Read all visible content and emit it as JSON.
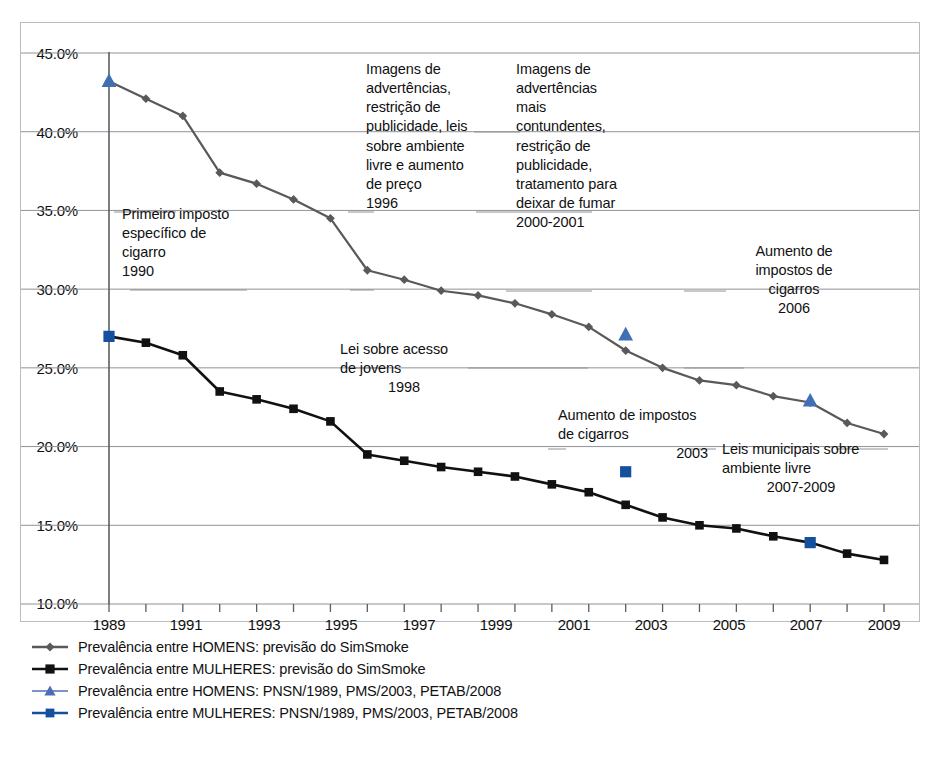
{
  "chart_data": {
    "type": "line",
    "title": "",
    "xlabel": "",
    "ylabel": "",
    "xlim": [
      1989,
      2010
    ],
    "ylim": [
      10.0,
      45.0
    ],
    "grid": true,
    "legend_position": "bottom-left",
    "ytick_labels": [
      "45.0%",
      "40.0%",
      "35.0%",
      "30.0%",
      "25.0%",
      "20.0%",
      "15.0%",
      "10.0%"
    ],
    "ytick_values": [
      45.0,
      40.0,
      35.0,
      30.0,
      25.0,
      20.0,
      15.0,
      10.0
    ],
    "xtick_labels": [
      "1989",
      "1991",
      "1993",
      "1995",
      "1997",
      "1999",
      "2001",
      "2003",
      "2005",
      "2007",
      "2009"
    ],
    "xtick_values": [
      1989,
      1991,
      1993,
      1995,
      1997,
      1999,
      2001,
      2003,
      2005,
      2007,
      2009
    ],
    "x": [
      1989,
      1990,
      1991,
      1992,
      1993,
      1994,
      1995,
      1996,
      1997,
      1998,
      1999,
      2000,
      2001,
      2002,
      2003,
      2004,
      2005,
      2006,
      2007,
      2008,
      2009,
      2010
    ],
    "series": [
      {
        "name": "Prevalência entre HOMENS: previsão do SimSmoke",
        "marker": "diamond",
        "color": "#595959",
        "values": [
          43.2,
          42.1,
          41.0,
          37.4,
          36.7,
          35.7,
          34.5,
          31.2,
          30.6,
          29.9,
          29.6,
          29.1,
          28.4,
          27.6,
          26.1,
          25.0,
          24.2,
          23.9,
          23.2,
          22.8,
          21.5,
          20.8
        ]
      },
      {
        "name": "Prevalência entre MULHERES: previsão do SimSmoke",
        "marker": "square",
        "color": "#111111",
        "values": [
          27.0,
          26.6,
          25.8,
          23.5,
          23.0,
          22.4,
          21.6,
          19.5,
          19.1,
          18.7,
          18.4,
          18.1,
          17.6,
          17.1,
          16.3,
          15.5,
          15.0,
          14.8,
          14.3,
          13.9,
          13.2,
          12.8
        ]
      },
      {
        "name": "Prevalência entre HOMENS: PNSN/1989, PMS/2003, PETAB/2008",
        "marker": "triangle",
        "color": "#3f6fb5",
        "points": [
          {
            "x": 1989,
            "y": 43.2
          },
          {
            "x": 2003,
            "y": 27.1
          },
          {
            "x": 2008,
            "y": 22.9
          }
        ]
      },
      {
        "name": "Prevalência entre MULHERES: PNSN/1989, PMS/2003, PETAB/2008",
        "marker": "square",
        "color": "#15509e",
        "points": [
          {
            "x": 1989,
            "y": 27.0
          },
          {
            "x": 2003,
            "y": 18.4
          },
          {
            "x": 2008,
            "y": 13.9
          }
        ]
      }
    ],
    "annotations": [
      {
        "id": "a1990",
        "text": "Primeiro imposto específico de cigarro",
        "year": "1990"
      },
      {
        "id": "a1996",
        "text": "Imagens de advertências, restrição de publicidade, leis sobre ambiente livre e aumento de preço",
        "year": "1996"
      },
      {
        "id": "a1998",
        "text": "Lei sobre acesso de jovens",
        "year": "1998"
      },
      {
        "id": "a2000",
        "text": "Imagens de advertências mais contundentes, restrição de publicidade, tratamento para deixar de fumar",
        "year": "2000-2001"
      },
      {
        "id": "a2003",
        "text": "Aumento de impostos de cigarros",
        "year": "2003"
      },
      {
        "id": "a2006",
        "text": "Aumento de impostos de cigarros",
        "year": "2006"
      },
      {
        "id": "a2007",
        "text": "Leis municipais sobre ambiente livre",
        "year": "2007-2009"
      }
    ]
  },
  "annotations_text": {
    "a1990": {
      "l1": "Primeiro imposto",
      "l2": "específico de",
      "l3": "cigarro",
      "year": "1990"
    },
    "a1996": {
      "l1": "Imagens de",
      "l2": "advertências,",
      "l3": "restrição de",
      "l4": "publicidade, leis",
      "l5": "sobre ambiente",
      "l6": "livre e aumento",
      "l7": "de preço",
      "year": "1996"
    },
    "a1998": {
      "l1": "Lei sobre acesso",
      "l2": "de jovens",
      "year": "1998"
    },
    "a2000": {
      "l1": "Imagens de",
      "l2": "advertências",
      "l3": "mais",
      "l4": "contundentes,",
      "l5": "restrição de",
      "l6": "publicidade,",
      "l7": "tratamento para",
      "l8": "deixar de fumar",
      "year": "2000-2001"
    },
    "a2003": {
      "l1": "Aumento de impostos",
      "l2": "de cigarros",
      "year": "2003"
    },
    "a2006": {
      "l1": "Aumento de",
      "l2": "impostos de",
      "l3": "cigarros",
      "year": "2006"
    },
    "a2007": {
      "l1": "Leis municipais sobre",
      "l2": "ambiente livre",
      "year": "2007-2009"
    }
  },
  "legend": {
    "items": [
      {
        "label": "Prevalência entre HOMENS: previsão do SimSmoke",
        "marker": "diamond",
        "color": "#595959"
      },
      {
        "label": "Prevalência entre MULHERES: previsão do SimSmoke",
        "marker": "square",
        "color": "#111111"
      },
      {
        "label": "Prevalência entre HOMENS: PNSN/1989, PMS/2003, PETAB/2008",
        "marker": "triangle",
        "color": "#7a93c8"
      },
      {
        "label": "Prevalência entre MULHERES: PNSN/1989, PMS/2003, PETAB/2008",
        "marker": "square",
        "color": "#15509e"
      }
    ]
  },
  "colors": {
    "men_line": "#595959",
    "women_line": "#111111",
    "men_survey": "#3f6fb5",
    "women_survey": "#15509e",
    "grid": "#8f9297",
    "frame": "#b9bcc0"
  }
}
